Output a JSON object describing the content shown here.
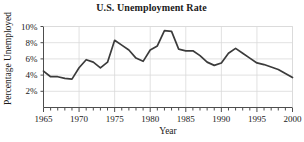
{
  "chart_data": {
    "type": "line",
    "title": "U.S. Unemployment Rate",
    "xlabel": "Year",
    "ylabel": "Percentage Unemployed",
    "xlim": [
      1965,
      2000
    ],
    "ylim": [
      0,
      10
    ],
    "grid": true,
    "legend": null,
    "line_color": "#3b3b3b",
    "grid_color": "#d9d9d9",
    "axis_color": "#4d4d4d",
    "x": [
      1965,
      1966,
      1967,
      1968,
      1969,
      1970,
      1971,
      1972,
      1973,
      1974,
      1975,
      1976,
      1977,
      1978,
      1979,
      1980,
      1981,
      1982,
      1983,
      1984,
      1985,
      1986,
      1987,
      1988,
      1989,
      1990,
      1991,
      1992,
      1993,
      1994,
      1995,
      1996,
      1997,
      1998,
      1999,
      2000
    ],
    "values": [
      4.5,
      3.8,
      3.8,
      3.6,
      3.5,
      4.9,
      5.9,
      5.6,
      4.9,
      5.6,
      8.3,
      7.7,
      7.1,
      6.1,
      5.7,
      7.1,
      7.6,
      9.5,
      9.4,
      7.2,
      7.0,
      7.0,
      6.4,
      5.6,
      5.2,
      5.5,
      6.7,
      7.3,
      6.7,
      6.1,
      5.5,
      5.3,
      5.0,
      4.7,
      4.2,
      3.7
    ],
    "y_ticks": [
      2,
      4,
      6,
      8,
      10
    ],
    "y_tick_labels": [
      "2%",
      "4%",
      "6%",
      "8%",
      "10%"
    ],
    "x_major_ticks": [
      1965,
      1970,
      1975,
      1980,
      1985,
      1990,
      1995,
      2000
    ],
    "x_major_labels": [
      "1965",
      "1970",
      "1975",
      "1980",
      "1985",
      "1990",
      "1995",
      "2000"
    ],
    "x_minor_tick_step": 1
  }
}
